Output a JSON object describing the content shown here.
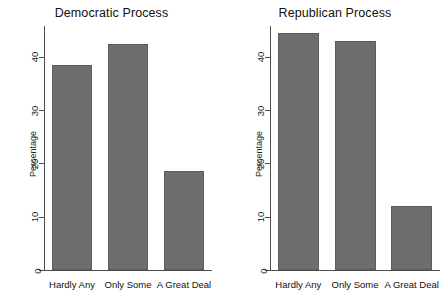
{
  "chart_data": [
    {
      "type": "bar",
      "title": "Democratic Process",
      "xlabel": "",
      "ylabel": "Percentage",
      "categories": [
        "Hardly Any",
        "Only Some",
        "A Great Deal"
      ],
      "values": [
        38.5,
        42.5,
        18.5
      ],
      "yticks": [
        0,
        10,
        20,
        30,
        40
      ],
      "ylim": [
        0,
        46
      ],
      "grid": false,
      "legend": "none",
      "bar_color": "#6e6e6e"
    },
    {
      "type": "bar",
      "title": "Republican Process",
      "xlabel": "",
      "ylabel": "Percentage",
      "categories": [
        "Hardly Any",
        "Only Some",
        "A Great Deal"
      ],
      "values": [
        44.5,
        43.0,
        12.0
      ],
      "yticks": [
        0,
        10,
        20,
        30,
        40
      ],
      "ylim": [
        0,
        46
      ],
      "grid": false,
      "legend": "none",
      "bar_color": "#6e6e6e"
    }
  ],
  "panels": [
    {
      "title": "Democratic Process",
      "ylabel": "Percentage",
      "ticks": [
        {
          "label": "0"
        },
        {
          "label": "10"
        },
        {
          "label": "20"
        },
        {
          "label": "30"
        },
        {
          "label": "40"
        }
      ],
      "bars": [
        {
          "label": "Hardly Any",
          "value": 38.5
        },
        {
          "label": "Only Some",
          "value": 42.5
        },
        {
          "label": "A Great Deal",
          "value": 18.5
        }
      ]
    },
    {
      "title": "Republican Process",
      "ylabel": "Percentage",
      "ticks": [
        {
          "label": "0"
        },
        {
          "label": "10"
        },
        {
          "label": "20"
        },
        {
          "label": "30"
        },
        {
          "label": "40"
        }
      ],
      "bars": [
        {
          "label": "Hardly Any",
          "value": 44.5
        },
        {
          "label": "Only Some",
          "value": 43.0
        },
        {
          "label": "A Great Deal",
          "value": 12.0
        }
      ]
    }
  ]
}
